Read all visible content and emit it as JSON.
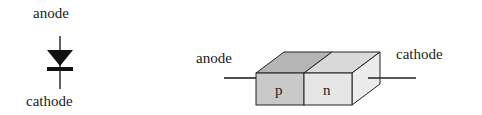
{
  "symbol": {
    "top_label": "anode",
    "bottom_label": "cathode"
  },
  "block": {
    "left_label": "anode",
    "right_label": "cathode",
    "p_region": "p",
    "n_region": "n"
  },
  "colors": {
    "line": "#222222",
    "p_front": "#c9c9c9",
    "p_top": "#b5b5b5",
    "n_front": "#e6e6e6",
    "n_top": "#dadada",
    "side": "#ececec"
  }
}
